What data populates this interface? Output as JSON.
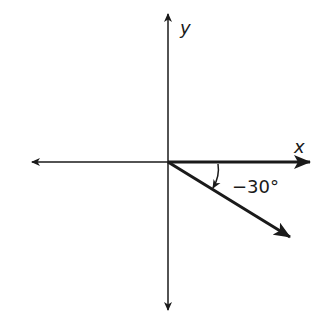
{
  "diagram": {
    "x_axis_label": "x",
    "y_axis_label": "y",
    "angle_label": "−30°",
    "angle_degrees": -30,
    "colors": {
      "ink": "#1a1a1a",
      "background": "#ffffff"
    }
  }
}
